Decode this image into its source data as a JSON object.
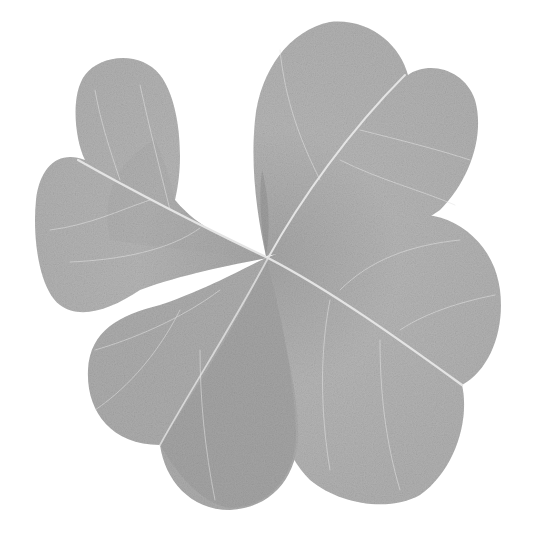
{
  "image": {
    "subject": "four-leaf clover",
    "alt": "Grayscale photograph of a four-leaf clover on a white background",
    "background_color": "#ffffff",
    "leaf_color": "#b4b4b4",
    "leaf_shadow_color": "#9e9e9e",
    "vein_color": "#e2e2e2",
    "center": [
      268,
      258
    ],
    "leaves": [
      {
        "name": "top-left leaf"
      },
      {
        "name": "top-right leaf"
      },
      {
        "name": "bottom-right leaf"
      },
      {
        "name": "bottom-left leaf"
      }
    ]
  }
}
